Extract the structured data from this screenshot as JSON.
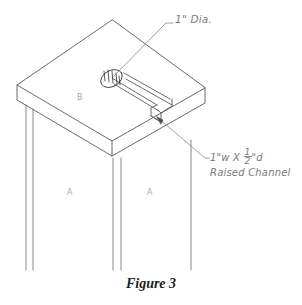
{
  "figure": {
    "caption": "Figure 3"
  },
  "annotations": {
    "hole": {
      "text": "1\" Dia.",
      "name": "hole-diameter-callout"
    },
    "channel": {
      "line1_prefix": "1\"w X ",
      "fraction_numerator": "1",
      "fraction_denominator": "2",
      "line1_suffix": "\"d",
      "line2": "Raised Channel",
      "name": "raised-channel-callout"
    }
  },
  "part_labels": {
    "top": "B",
    "leg_left": "A",
    "leg_right": "A"
  },
  "colors": {
    "line": "#5a5a5a",
    "leader": "#8a8a8a",
    "annotation_text": "#7b7b7b",
    "part_letter": "#a8a8a8",
    "caption": "#1c1c1c",
    "background": "#ffffff"
  }
}
